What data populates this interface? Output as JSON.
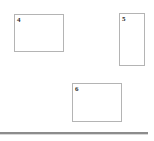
{
  "canvas": {
    "width": 154,
    "height": 141,
    "background_color": "#ffffff"
  },
  "regions": [
    {
      "label": "4",
      "name": "region-box-4",
      "x": 14,
      "y": 14,
      "width": 50,
      "height": 38,
      "border_color": "#b4b4b4",
      "fill_color": "#ffffff"
    },
    {
      "label": "5",
      "name": "region-box-5",
      "x": 119,
      "y": 13,
      "width": 26,
      "height": 53,
      "border_color": "#b4b4b4",
      "fill_color": "#ffffff"
    },
    {
      "label": "6",
      "name": "region-box-6",
      "x": 72,
      "y": 83,
      "width": 50,
      "height": 39,
      "border_color": "#b4b4b4",
      "fill_color": "#ffffff"
    }
  ],
  "divider": {
    "name": "bottom-divider",
    "x": 0,
    "y": 132,
    "width": 148,
    "height": 2,
    "color": "#8c8c8c",
    "shadow_color": "#d8d8d8"
  }
}
